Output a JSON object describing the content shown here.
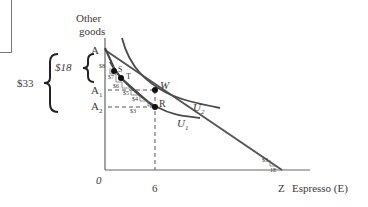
{
  "diagram": {
    "axes": {
      "y_label_line1": "Other",
      "y_label_line2": "goods",
      "x_label": "Espresso (E)",
      "origin": "0",
      "x_tick": "6"
    },
    "points": {
      "A": "A",
      "A1": "A",
      "A1_sub": "1",
      "A2": "A",
      "A2_sub": "2",
      "Z": "Z",
      "S": "S",
      "T": "T",
      "W": "W",
      "R": "R"
    },
    "curves": {
      "U1": "U",
      "U1_sub": "1",
      "U2": "U",
      "U2_sub": "2"
    },
    "braces": {
      "outer": "$33",
      "inner": "$18"
    },
    "steps": [
      "$8",
      "$7",
      "$6",
      "$5",
      "$4",
      "$3"
    ],
    "slope_label": "$3",
    "slope_unit": "1E",
    "colors": {
      "line": "#555555",
      "curve": "#4a4a4a",
      "point": "#111111",
      "text": "#3a3a3a"
    }
  }
}
